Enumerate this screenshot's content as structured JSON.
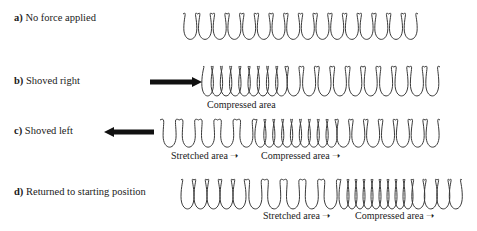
{
  "rows": [
    {
      "id": "a",
      "letter": "a)",
      "text": " No force applied",
      "label_pos": [
        14,
        12
      ],
      "force": null,
      "spring": {
        "y_top": 12,
        "y_bot": 42,
        "segments": [
          {
            "x0": 183,
            "x1": 418,
            "coils": 16
          }
        ]
      },
      "areas": []
    },
    {
      "id": "b",
      "letter": "b)",
      "text": " Shoved right",
      "label_pos": [
        14,
        75
      ],
      "force": {
        "direction": "right",
        "x_tail": 150,
        "x_head": 202,
        "y": 82
      },
      "spring": {
        "y_top": 65,
        "y_bot": 99,
        "segments": [
          {
            "x0": 203,
            "x1": 286,
            "coils": 9
          },
          {
            "x0": 286,
            "x1": 440,
            "coils": 10
          }
        ]
      },
      "areas": [
        {
          "label": "Compressed area",
          "arrow": false,
          "x": 207,
          "y": 99
        }
      ]
    },
    {
      "id": "c",
      "letter": "c)",
      "text": " Shoved left",
      "label_pos": [
        14,
        125
      ],
      "force": {
        "direction": "left",
        "x_tail": 154,
        "x_head": 104,
        "y": 132
      },
      "spring": {
        "y_top": 118,
        "y_bot": 150,
        "segments": [
          {
            "x0": 160,
            "x1": 256,
            "coils": 5
          },
          {
            "x0": 256,
            "x1": 336,
            "coils": 9
          },
          {
            "x0": 336,
            "x1": 440,
            "coils": 7
          }
        ]
      },
      "areas": [
        {
          "label": "Stretched area",
          "arrow": true,
          "x": 171,
          "y": 150
        },
        {
          "label": "Compressed area",
          "arrow": true,
          "x": 261,
          "y": 150
        }
      ]
    },
    {
      "id": "d",
      "letter": "d)",
      "text": " Returned to starting position",
      "label_pos": [
        14,
        186
      ],
      "force": null,
      "spring": {
        "y_top": 178,
        "y_bot": 212,
        "segments": [
          {
            "x0": 181,
            "x1": 246,
            "coils": 5
          },
          {
            "x0": 246,
            "x1": 340,
            "coils": 5
          },
          {
            "x0": 340,
            "x1": 412,
            "coils": 9
          },
          {
            "x0": 412,
            "x1": 462,
            "coils": 4
          }
        ]
      },
      "areas": [
        {
          "label": "Stretched area",
          "arrow": true,
          "x": 263,
          "y": 210
        },
        {
          "label": "Compressed area",
          "arrow": true,
          "x": 355,
          "y": 210
        }
      ]
    }
  ],
  "colors": {
    "spring": "#3a3a3a",
    "arrow": "#111111",
    "text": "#1a1a1a"
  }
}
